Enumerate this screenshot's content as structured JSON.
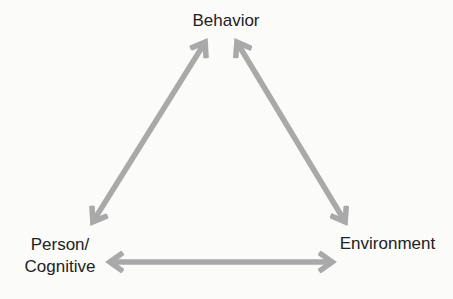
{
  "diagram": {
    "nodes": {
      "behavior": {
        "label": "Behavior"
      },
      "person": {
        "label_line1": "Person/",
        "label_line2": "Cognitive"
      },
      "environment": {
        "label": "Environment"
      }
    },
    "edges": [
      {
        "from": "behavior",
        "to": "person",
        "type": "bidirectional-arrow"
      },
      {
        "from": "behavior",
        "to": "environment",
        "type": "bidirectional-arrow"
      },
      {
        "from": "person",
        "to": "environment",
        "type": "bidirectional-arrow"
      }
    ],
    "colors": {
      "arrow": "#a9a9a9",
      "text": "#222222",
      "background": "#fbfbfa"
    }
  }
}
